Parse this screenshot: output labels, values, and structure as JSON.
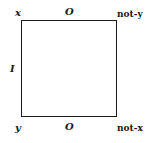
{
  "diagram": {
    "type": "square-of-opposition",
    "corners": {
      "top_left": "x",
      "top_right": "not-y",
      "bottom_left": "y",
      "bottom_right": "not-x"
    },
    "sides": {
      "top": "O",
      "bottom": "O",
      "left": "I"
    }
  }
}
